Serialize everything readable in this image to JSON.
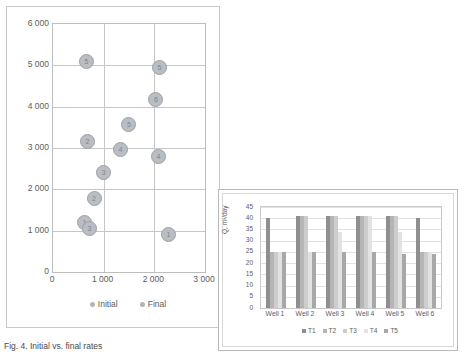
{
  "caption": "Fig. 4. Initial vs. final rates",
  "scatter": {
    "legend": [
      {
        "label": "Initial",
        "color": "#b0b6bc"
      },
      {
        "label": "Final",
        "color": "#b0b6bc"
      }
    ]
  },
  "bar": {
    "legend": [
      {
        "label": "T1",
        "color": "#8f8f8f"
      },
      {
        "label": "T2",
        "color": "#b5b5b5"
      },
      {
        "label": "T3",
        "color": "#cdcdcd"
      },
      {
        "label": "T4",
        "color": "#e2e2e2"
      },
      {
        "label": "T5",
        "color": "#a8a8a8"
      }
    ]
  },
  "chart_data": [
    {
      "type": "scatter",
      "title": "",
      "xlabel": "",
      "ylabel": "",
      "xlim": [
        0,
        3000
      ],
      "ylim": [
        0,
        6000
      ],
      "xticks": [
        "0",
        "1 000",
        "2 000",
        "3 000"
      ],
      "yticks": [
        "0",
        "1 000",
        "2 000",
        "3 000",
        "4 000",
        "5 000",
        "6 000"
      ],
      "grid": true,
      "legend_position": "bottom",
      "series": [
        {
          "name": "Initial",
          "points": [
            {
              "label": "5",
              "x": 640,
              "y": 5120
            },
            {
              "label": "2",
              "x": 660,
              "y": 3190
            },
            {
              "label": "3",
              "x": 980,
              "y": 2420
            },
            {
              "label": "2",
              "x": 790,
              "y": 1800
            },
            {
              "label": "1",
              "x": 600,
              "y": 1210
            },
            {
              "label": "3",
              "x": 700,
              "y": 1080
            }
          ]
        },
        {
          "name": "Final",
          "points": [
            {
              "label": "5",
              "x": 2080,
              "y": 4960
            },
            {
              "label": "6",
              "x": 2010,
              "y": 4190
            },
            {
              "label": "5",
              "x": 1480,
              "y": 3600
            },
            {
              "label": "4",
              "x": 1310,
              "y": 3000
            },
            {
              "label": "4",
              "x": 2060,
              "y": 2830
            },
            {
              "label": "1",
              "x": 2260,
              "y": 920
            }
          ]
        }
      ]
    },
    {
      "type": "bar",
      "title": "",
      "xlabel": "",
      "ylabel": "Q, m³/day",
      "ylim": [
        0,
        45
      ],
      "yticks": [
        "0",
        "5",
        "10",
        "15",
        "20",
        "25",
        "30",
        "35",
        "40",
        "45"
      ],
      "grid": true,
      "legend_position": "bottom",
      "categories": [
        "Well 1",
        "Well 2",
        "Well 3",
        "Well 4",
        "Well 5",
        "Well 6"
      ],
      "series": [
        {
          "name": "T1",
          "values": [
            40,
            41,
            41,
            41,
            41,
            40
          ]
        },
        {
          "name": "T2",
          "values": [
            25,
            41,
            41,
            41,
            41,
            25
          ]
        },
        {
          "name": "T3",
          "values": [
            25,
            41,
            41,
            41,
            41,
            25
          ]
        },
        {
          "name": "T4",
          "values": [
            25,
            25,
            34,
            41,
            34,
            25
          ]
        },
        {
          "name": "T5",
          "values": [
            25,
            25,
            25,
            25,
            24,
            24
          ]
        }
      ]
    }
  ]
}
